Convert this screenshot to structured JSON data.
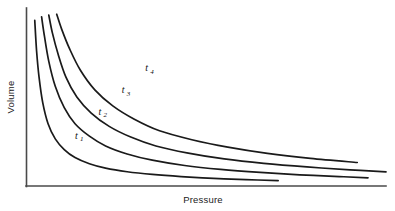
{
  "chart_data": {
    "type": "line",
    "title": "",
    "subtitle": "",
    "xlabel": "Pressure",
    "ylabel": "Volume",
    "grid": false,
    "legend_position": "inline-curve-labels",
    "axis_ticks": "none",
    "axis_numbers": "none",
    "xlim": [
      0,
      100
    ],
    "ylim": [
      0,
      100
    ],
    "series": [
      {
        "name": "t1",
        "label": "t",
        "subscript": "1",
        "constant": 10.5,
        "color": "#1a1a1a",
        "label_x": 13.5,
        "label_y": 26.5,
        "x": [
          2.3,
          2.8,
          3.5,
          4.5,
          6.0,
          8.0,
          10.5,
          13.5,
          17.5,
          22.0,
          28.0,
          35.0,
          43.0,
          52.0,
          61.0,
          70.0
        ],
        "y": [
          93.0,
          76.0,
          61.0,
          47.0,
          35.0,
          26.5,
          20.5,
          16.0,
          12.5,
          10.0,
          8.0,
          6.5,
          5.3,
          4.3,
          3.6,
          3.0
        ]
      },
      {
        "name": "t2",
        "label": "t",
        "subscript": "2",
        "constant": 21.0,
        "color": "#1a1a1a",
        "label_x": 20.0,
        "label_y": 40.0,
        "x": [
          4.2,
          5.0,
          6.2,
          8.0,
          10.5,
          13.5,
          17.5,
          22.0,
          28.0,
          35.0,
          44.0,
          54.0,
          65.0,
          76.0,
          87.0,
          95.0
        ],
        "y": [
          95.0,
          84.0,
          70.0,
          56.0,
          44.0,
          35.0,
          28.0,
          22.5,
          18.0,
          14.5,
          11.5,
          9.3,
          7.6,
          6.3,
          5.3,
          4.6
        ]
      },
      {
        "name": "t3",
        "label": "t",
        "subscript": "3",
        "constant": 33.0,
        "color": "#1a1a1a",
        "label_x": 26.5,
        "label_y": 52.0,
        "x": [
          6.2,
          7.2,
          8.8,
          11.0,
          14.0,
          18.0,
          23.0,
          29.0,
          36.0,
          45.0,
          55.0,
          66.0,
          78.0,
          90.0,
          100.0,
          108.0
        ],
        "y": [
          96.0,
          86.0,
          74.0,
          61.0,
          50.0,
          41.0,
          33.5,
          27.5,
          22.5,
          18.5,
          15.2,
          12.7,
          10.7,
          9.1,
          7.9,
          7.0
        ]
      },
      {
        "name": "t4",
        "label": "t",
        "subscript": "4",
        "constant": 48.0,
        "color": "#1a1a1a",
        "label_x": 33.0,
        "label_y": 64.5,
        "x": [
          8.4,
          9.8,
          12.0,
          15.0,
          19.0,
          24.0,
          30.0,
          37.0,
          46.0,
          56.0,
          67.0,
          79.0,
          92.0,
          105.0,
          117.0,
          128.0
        ],
        "y": [
          96.5,
          88.0,
          77.0,
          65.0,
          54.0,
          45.0,
          37.5,
          31.0,
          26.0,
          21.8,
          18.3,
          15.5,
          13.2,
          11.3,
          9.8,
          8.6
        ]
      }
    ]
  },
  "axes": {
    "y_title": "Volume",
    "x_title": "Pressure"
  },
  "labels": {
    "t1_base": "t",
    "t1_sub": "1",
    "t2_base": "t",
    "t2_sub": "2",
    "t3_base": "t",
    "t3_sub": "3",
    "t4_base": "t",
    "t4_sub": "4"
  },
  "colors": {
    "background": "#ffffff",
    "curve": "#1a1a1a",
    "axis": "#4a4a4a",
    "text": "#222222"
  }
}
